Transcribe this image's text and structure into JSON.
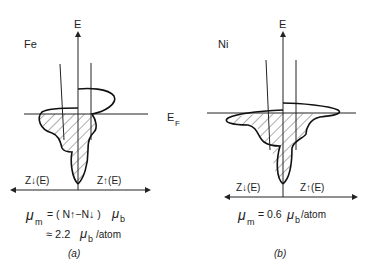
{
  "panels": [
    {
      "id": "a",
      "element": "Fe",
      "energy_axis_label": "E",
      "spin_down_label": "Z↓(E)",
      "spin_up_label": "Z↑(E)",
      "moment_line1": "μₘ = (N↑−N↓)μᵦ",
      "moment_symbol": "μ",
      "moment_sub": "m",
      "moment_eq1_rest": "= ( N↑−N↓ )",
      "moment_eq1_end_sub": "b",
      "moment_eq2_prefix": "≈ 2.2",
      "moment_eq2_unit": "/atom",
      "caption": "(a)"
    },
    {
      "id": "b",
      "element": "Ni",
      "energy_axis_label": "E",
      "spin_down_label": "Z↓(E)",
      "spin_up_label": "Z↑(E)",
      "moment_symbol": "μ",
      "moment_sub": "m",
      "moment_eq1_rest": "= 0.6",
      "moment_eq1_end_sub": "b",
      "moment_eq2_unit": "/atom",
      "caption": "(b)"
    }
  ],
  "fermi_label": "E",
  "fermi_sub": "F",
  "magnetic_moment_values": {
    "Fe_muB_per_atom": 2.2,
    "Ni_muB_per_atom": 0.6
  }
}
